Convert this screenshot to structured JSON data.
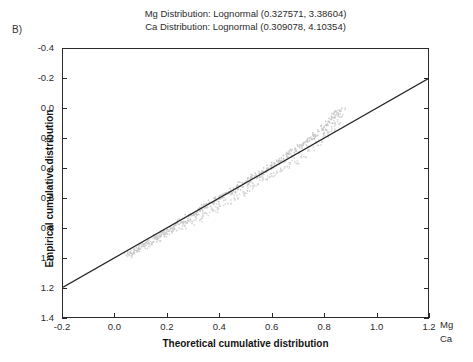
{
  "panel": {
    "label": "B)"
  },
  "title": {
    "line1": "Mg Distribution: Lognormal (0.327571, 3.38604)",
    "line2": "Ca Distribution: Lognormal (0.309078, 4.10354)"
  },
  "axes": {
    "xlabel": "Theoretical cumulative distribution",
    "ylabel": "Empirical cumulative distribution",
    "x_ticks": [
      "-0.2",
      "0.0",
      "0.2",
      "0.4",
      "0.6",
      "0.8",
      "1.0",
      "1.2"
    ],
    "y_ticks": [
      "1.4",
      "1.2",
      "1.0",
      "0.8",
      "0.6",
      "0.4",
      "0.2",
      "0.0",
      "-0.2",
      "-0.4"
    ]
  },
  "legend": {
    "items": [
      {
        "label": "Mg"
      },
      {
        "label": "Ca"
      }
    ]
  },
  "colors": {
    "frame": "#2a2a2a",
    "reference_line": "#262626",
    "mg_points": "#c9c9c9",
    "ca_points": "#d6d6d6",
    "background": "#ffffff"
  },
  "chart_data": {
    "type": "scatter",
    "xlabel": "Theoretical cumulative distribution",
    "ylabel": "Empirical cumulative distribution",
    "xlim": [
      -0.2,
      1.2
    ],
    "ylim": [
      -0.4,
      1.4
    ],
    "xticks": [
      -0.2,
      0.0,
      0.2,
      0.4,
      0.6,
      0.8,
      1.0,
      1.2
    ],
    "yticks": [
      -0.4,
      -0.2,
      0.0,
      0.2,
      0.4,
      0.6,
      0.8,
      1.0,
      1.2,
      1.4
    ],
    "grid": false,
    "legend_position": "outside-right-bottom",
    "distribution_fits": [
      {
        "element": "Mg",
        "distribution": "Lognormal",
        "mu": 0.327571,
        "sigma": 3.38604
      },
      {
        "element": "Ca",
        "distribution": "Lognormal",
        "mu": 0.309078,
        "sigma": 4.10354
      }
    ],
    "annotations": [
      {
        "text": "B)",
        "position": "top-left-outside"
      }
    ],
    "reference_line": {
      "name": "1:1 identity line",
      "from": [
        -0.2,
        -0.2
      ],
      "to": [
        1.2,
        1.2
      ],
      "color": "#262626",
      "width": 1.4
    },
    "series": [
      {
        "name": "Mg",
        "color": "#c9c9c9",
        "marker": "dot",
        "points": [
          [
            0.06,
            0.03
          ],
          [
            0.08,
            0.05
          ],
          [
            0.1,
            0.07
          ],
          [
            0.11,
            0.09
          ],
          [
            0.13,
            0.1
          ],
          [
            0.15,
            0.12
          ],
          [
            0.16,
            0.14
          ],
          [
            0.18,
            0.15
          ],
          [
            0.19,
            0.17
          ],
          [
            0.21,
            0.19
          ],
          [
            0.22,
            0.2
          ],
          [
            0.24,
            0.22
          ],
          [
            0.25,
            0.24
          ],
          [
            0.27,
            0.25
          ],
          [
            0.28,
            0.27
          ],
          [
            0.3,
            0.29
          ],
          [
            0.31,
            0.3
          ],
          [
            0.33,
            0.32
          ],
          [
            0.34,
            0.34
          ],
          [
            0.36,
            0.35
          ],
          [
            0.37,
            0.37
          ],
          [
            0.39,
            0.39
          ],
          [
            0.41,
            0.4
          ],
          [
            0.42,
            0.42
          ],
          [
            0.44,
            0.44
          ],
          [
            0.45,
            0.45
          ],
          [
            0.47,
            0.47
          ],
          [
            0.48,
            0.49
          ],
          [
            0.5,
            0.5
          ],
          [
            0.51,
            0.52
          ],
          [
            0.53,
            0.54
          ],
          [
            0.55,
            0.55
          ],
          [
            0.56,
            0.57
          ],
          [
            0.58,
            0.59
          ],
          [
            0.59,
            0.61
          ],
          [
            0.61,
            0.62
          ],
          [
            0.62,
            0.64
          ],
          [
            0.64,
            0.66
          ],
          [
            0.65,
            0.68
          ],
          [
            0.67,
            0.69
          ],
          [
            0.68,
            0.71
          ],
          [
            0.7,
            0.73
          ],
          [
            0.71,
            0.75
          ],
          [
            0.73,
            0.77
          ],
          [
            0.74,
            0.79
          ],
          [
            0.76,
            0.81
          ],
          [
            0.77,
            0.83
          ],
          [
            0.79,
            0.85
          ],
          [
            0.8,
            0.87
          ],
          [
            0.82,
            0.9
          ],
          [
            0.83,
            0.92
          ],
          [
            0.84,
            0.95
          ],
          [
            0.85,
            0.97
          ]
        ]
      },
      {
        "name": "Ca",
        "color": "#d6d6d6",
        "marker": "dot",
        "points": [
          [
            0.05,
            0.02
          ],
          [
            0.07,
            0.04
          ],
          [
            0.09,
            0.06
          ],
          [
            0.12,
            0.08
          ],
          [
            0.14,
            0.11
          ],
          [
            0.17,
            0.13
          ],
          [
            0.2,
            0.16
          ],
          [
            0.23,
            0.18
          ],
          [
            0.26,
            0.21
          ],
          [
            0.29,
            0.23
          ],
          [
            0.32,
            0.26
          ],
          [
            0.35,
            0.29
          ],
          [
            0.38,
            0.31
          ],
          [
            0.4,
            0.34
          ],
          [
            0.43,
            0.37
          ],
          [
            0.46,
            0.4
          ],
          [
            0.49,
            0.43
          ],
          [
            0.52,
            0.46
          ],
          [
            0.54,
            0.49
          ],
          [
            0.57,
            0.52
          ],
          [
            0.6,
            0.55
          ],
          [
            0.63,
            0.58
          ],
          [
            0.66,
            0.62
          ],
          [
            0.69,
            0.65
          ],
          [
            0.72,
            0.69
          ],
          [
            0.75,
            0.73
          ],
          [
            0.78,
            0.77
          ],
          [
            0.81,
            0.82
          ],
          [
            0.83,
            0.86
          ],
          [
            0.85,
            0.91
          ],
          [
            0.86,
            0.96
          ],
          [
            0.87,
            1.0
          ]
        ]
      }
    ]
  }
}
